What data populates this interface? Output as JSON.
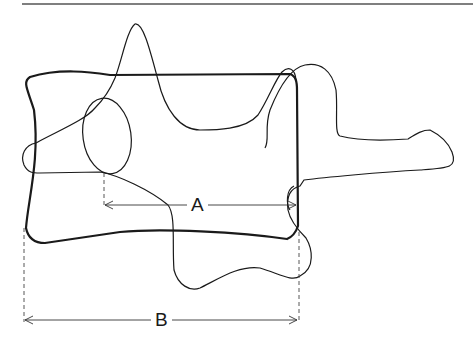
{
  "figure": {
    "colors": {
      "stroke": "#1a1a1a",
      "background": "#ffffff"
    },
    "labels": {
      "a": "A",
      "b": "B"
    },
    "dimensions": [
      {
        "id": "A",
        "from_x": 104,
        "to_x": 298,
        "y": 204
      },
      {
        "id": "B",
        "from_x": 24,
        "to_x": 298,
        "y": 320
      }
    ]
  }
}
